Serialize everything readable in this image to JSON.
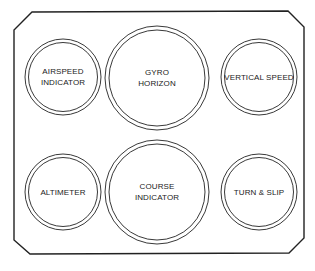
{
  "diagram": {
    "colors": {
      "line": "#222222",
      "background": "#ffffff"
    },
    "instruments": [
      {
        "id": "airspeed",
        "label_lines": [
          "AIRSPEED",
          "INDICATOR"
        ],
        "cx": 63,
        "cy": 77,
        "r": 38,
        "row": 1,
        "col": 1
      },
      {
        "id": "gyro",
        "label_lines": [
          "GYRO",
          "HORIZON"
        ],
        "cx": 157,
        "cy": 78,
        "r": 52,
        "row": 1,
        "col": 2
      },
      {
        "id": "vertical-speed",
        "label_lines": [
          "VERTICAL SPEED"
        ],
        "cx": 259,
        "cy": 77,
        "r": 38,
        "row": 1,
        "col": 3
      },
      {
        "id": "altimeter",
        "label_lines": [
          "ALTIMETER"
        ],
        "cx": 63,
        "cy": 192,
        "r": 38,
        "row": 2,
        "col": 1
      },
      {
        "id": "course",
        "label_lines": [
          "COURSE",
          "INDICATOR"
        ],
        "cx": 157,
        "cy": 192,
        "r": 52,
        "row": 2,
        "col": 2
      },
      {
        "id": "turn-slip",
        "label_lines": [
          "TURN & SLIP"
        ],
        "cx": 259,
        "cy": 192,
        "r": 38,
        "row": 2,
        "col": 3
      }
    ]
  }
}
